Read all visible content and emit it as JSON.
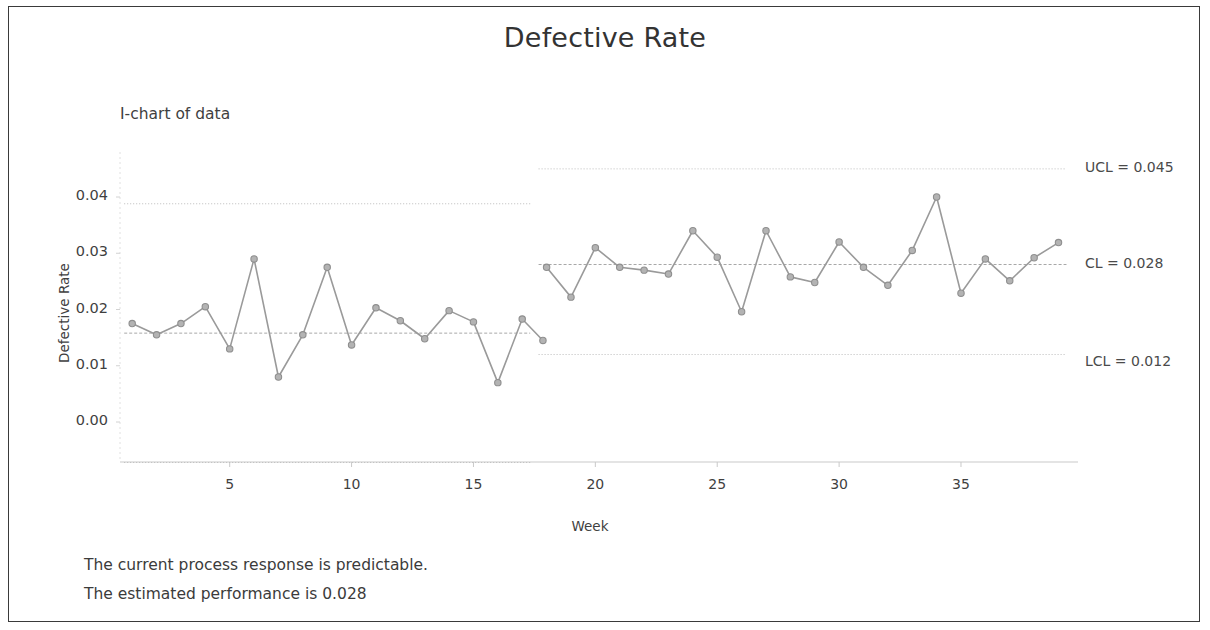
{
  "window": {
    "border_color": "#3a3a3a",
    "background": "#ffffff"
  },
  "header": {
    "title": "Defective Rate"
  },
  "chart_subtitle": "I-chart of data",
  "footer": {
    "line1": "The current process response is predictable.",
    "line2": "The estimated performance is 0.028"
  },
  "annotations": {
    "ucl": "UCL = 0.045",
    "cl": "CL = 0.028",
    "lcl": "LCL = 0.012"
  },
  "chart_data": {
    "type": "line",
    "chart_kind": "control-chart-individuals",
    "title": "Defective Rate",
    "subtitle": "I-chart of data",
    "xlabel": "Week",
    "ylabel": "Defective Rate",
    "xlim": [
      0.5,
      39.8
    ],
    "ylim": [
      -0.0072,
      0.0465
    ],
    "grid": false,
    "legend": false,
    "series_color": "#9a9a9a",
    "limit_line_color": "#bcbcbc",
    "center_line_color": "#a8a8a8",
    "x_ticks": [
      5,
      10,
      15,
      20,
      25,
      30,
      35
    ],
    "x_tick_labels": [
      "5",
      "10",
      "15",
      "20",
      "25",
      "30",
      "35"
    ],
    "y_ticks": [
      0.0,
      0.01,
      0.02,
      0.03,
      0.04
    ],
    "y_tick_labels": [
      "0.00",
      "0.01",
      "0.02",
      "0.03",
      "0.04"
    ],
    "phases": [
      {
        "name": "phase-1",
        "x_start": 1,
        "x_end": 17,
        "ucl": 0.0388,
        "cl": 0.0158,
        "lcl": -0.0072,
        "x": [
          1,
          2,
          3,
          4,
          5,
          6,
          7,
          8,
          9,
          10,
          11,
          12,
          13,
          14,
          15,
          16,
          17
        ],
        "values": [
          0.0175,
          0.0155,
          0.0175,
          0.0205,
          0.013,
          0.029,
          0.008,
          0.0155,
          0.0275,
          0.0137,
          0.0203,
          0.018,
          0.0148,
          0.0198,
          0.0178,
          0.007,
          0.0183
        ]
      },
      {
        "name": "phase-2",
        "x_start": 18,
        "x_end": 39,
        "ucl": 0.045,
        "cl": 0.028,
        "lcl": 0.012,
        "x": [
          18,
          19,
          20,
          21,
          22,
          23,
          24,
          25,
          26,
          27,
          28,
          29,
          30,
          31,
          32,
          33,
          34,
          35,
          36,
          37,
          38,
          39
        ],
        "values": [
          0.0275,
          0.0222,
          0.031,
          0.0275,
          0.027,
          0.0263,
          0.034,
          0.0293,
          0.0196,
          0.034,
          0.0258,
          0.0248,
          0.032,
          0.0275,
          0.0243,
          0.0305,
          0.04,
          0.0229,
          0.029,
          0.0251,
          0.0292,
          0.0319
        ]
      }
    ],
    "extra_point": {
      "x": 17,
      "y": 0.0145
    }
  }
}
